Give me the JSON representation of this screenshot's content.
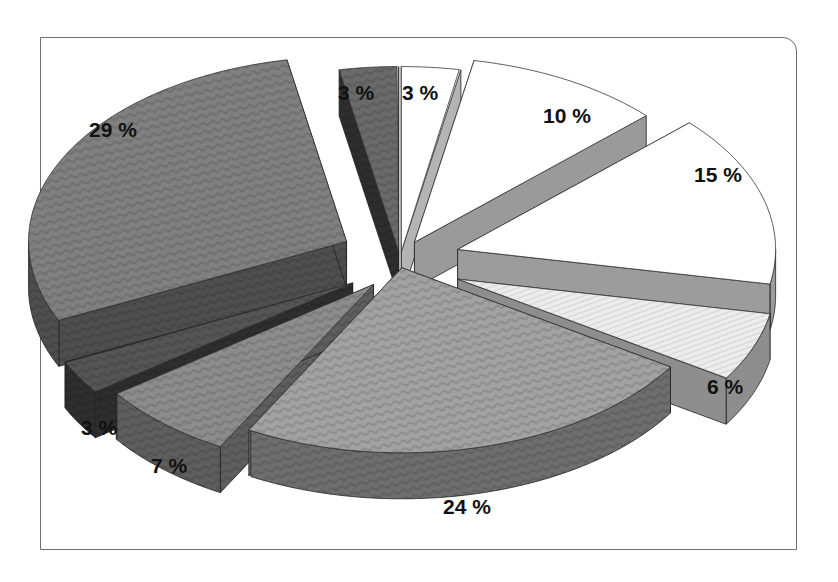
{
  "chart_data": {
    "type": "pie",
    "style": "3d-exploded",
    "title": "",
    "start_angle_deg": 0,
    "direction": "clockwise",
    "slices": [
      {
        "label": "3 %",
        "value": 3,
        "top": "#ffffff",
        "side": "#b4b4b4",
        "pattern": "none",
        "explode": 14,
        "label_pos": [
          402,
          93
        ]
      },
      {
        "label": "10 %",
        "value": 10,
        "top": "#ffffff",
        "side": "#9a9a9a",
        "pattern": "none",
        "explode": 30,
        "label_pos": [
          543,
          116
        ]
      },
      {
        "label": "15 %",
        "value": 15,
        "top": "#ffffff",
        "side": "#9c9c9c",
        "pattern": "none",
        "explode": 60,
        "label_pos": [
          694,
          175
        ]
      },
      {
        "label": "6 %",
        "value": 6,
        "top": "#ececec",
        "side": "#8e8e8e",
        "pattern": "dots",
        "explode": 62,
        "label_pos": [
          707,
          387
        ]
      },
      {
        "label": "24 %",
        "value": 24,
        "top": "#a2a2a2",
        "side": "#6e6e6e",
        "pattern": "wave",
        "explode": 8,
        "label_pos": [
          443,
          507
        ]
      },
      {
        "label": "7 %",
        "value": 7,
        "top": "#8c8c8c",
        "side": "#5e5e5e",
        "pattern": "wave",
        "explode": 40,
        "label_pos": [
          151,
          466
        ]
      },
      {
        "label": "3 %",
        "value": 3,
        "top": "#555555",
        "side": "#2e2e2e",
        "pattern": "wave",
        "explode": 55,
        "label_pos": [
          81,
          428
        ]
      },
      {
        "label": "29 %",
        "value": 29,
        "top": "#808080",
        "side": "#4e4e4e",
        "pattern": "wave",
        "explode": 60,
        "label_pos": [
          89,
          130
        ]
      },
      {
        "label": "3 %",
        "value": 3,
        "top": "#6a6a6a",
        "side": "#2e2e2e",
        "pattern": "wave",
        "explode": 14,
        "label_pos": [
          338,
          93
        ]
      }
    ],
    "legend": "none",
    "depth_px": 46
  },
  "frame": {
    "border_color": "#6e6e6e",
    "background": "#ffffff"
  }
}
